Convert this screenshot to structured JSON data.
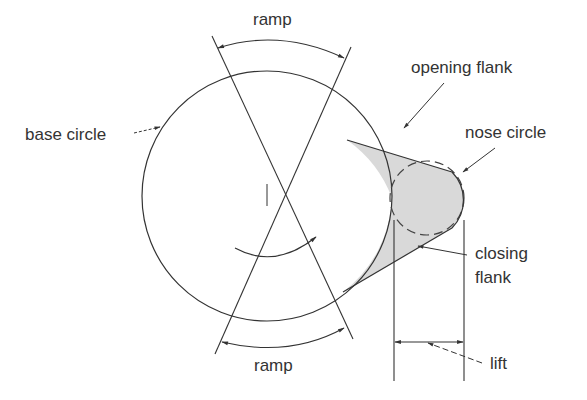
{
  "diagram": {
    "labels": {
      "ramp_top": "ramp",
      "ramp_bottom": "ramp",
      "base_circle": "base circle",
      "opening_flank": "opening flank",
      "nose_circle": "nose circle",
      "closing_flank_line1": "closing",
      "closing_flank_line2": "flank",
      "lift": "lift"
    },
    "colors": {
      "stroke": "#333333",
      "fill": "#d9d9d9",
      "text": "#333333"
    }
  }
}
